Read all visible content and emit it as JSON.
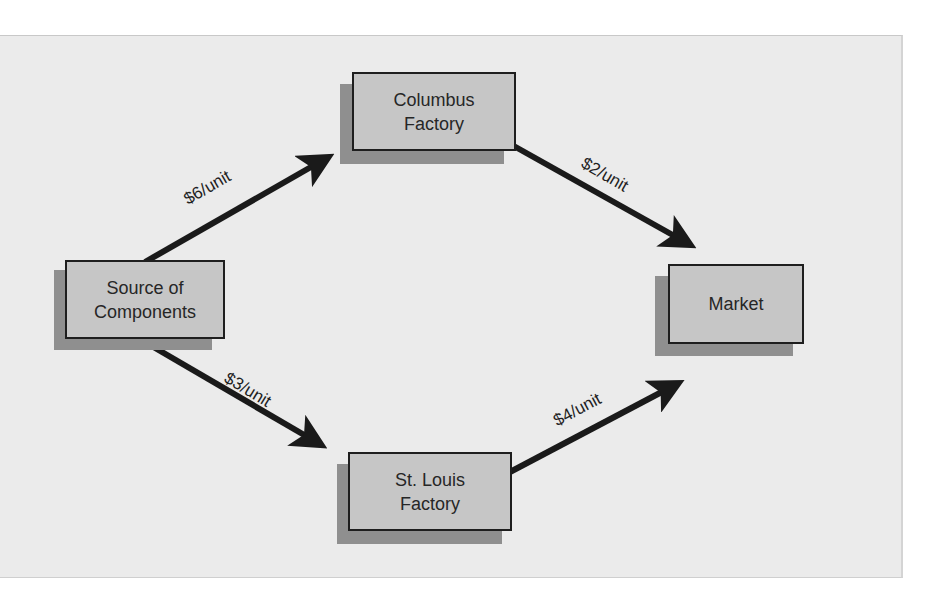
{
  "diagram": {
    "type": "flow-network",
    "nodes": [
      {
        "id": "source",
        "label": "Source of Components"
      },
      {
        "id": "columbus",
        "label": "Columbus Factory"
      },
      {
        "id": "stlouis",
        "label": "St. Louis Factory"
      },
      {
        "id": "market",
        "label": "Market"
      }
    ],
    "edges": [
      {
        "from": "source",
        "to": "columbus",
        "label": "$6/unit"
      },
      {
        "from": "columbus",
        "to": "market",
        "label": "$2/unit"
      },
      {
        "from": "source",
        "to": "stlouis",
        "label": "$3/unit"
      },
      {
        "from": "stlouis",
        "to": "market",
        "label": "$4/unit"
      }
    ]
  },
  "labels": {
    "source_line1": "Source of",
    "source_line2": "Components",
    "columbus_line1": "Columbus",
    "columbus_line2": "Factory",
    "stlouis_line1": "St. Louis",
    "stlouis_line2": "Factory",
    "market": "Market",
    "edge_source_columbus": "$6/unit",
    "edge_columbus_market": "$2/unit",
    "edge_source_stlouis": "$3/unit",
    "edge_stlouis_market": "$4/unit"
  },
  "colors": {
    "panel": "#ebebeb",
    "box_fill": "#c6c6c6",
    "box_shadow": "#8f8f8f",
    "border": "#1e1e1e",
    "arrow": "#1a1a1a"
  }
}
